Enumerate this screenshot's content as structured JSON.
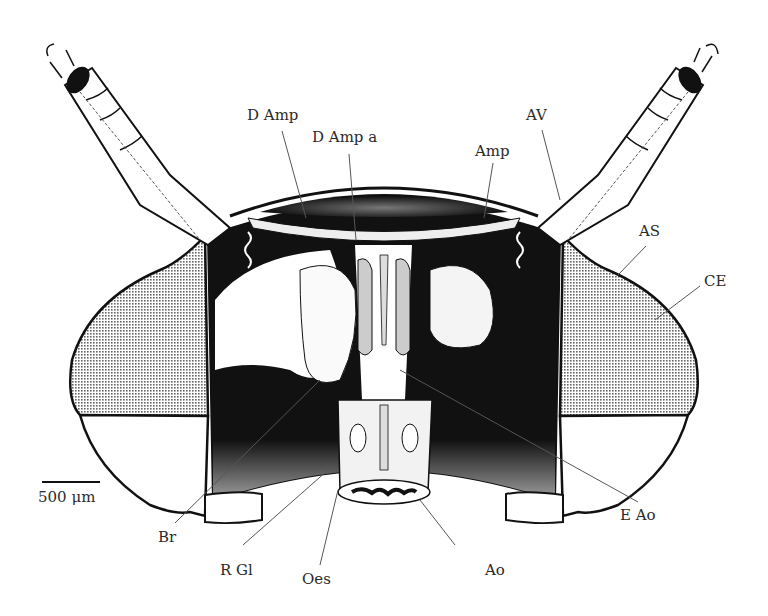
{
  "figure": {
    "colors": {
      "ink": "#111111",
      "leader": "#555555",
      "background": "#ffffff",
      "stipple": "#777777"
    }
  },
  "labels": {
    "d_amp": "D Amp",
    "d_amp_a": "D Amp a",
    "amp": "Amp",
    "av": "AV",
    "as": "AS",
    "ce": "CE",
    "br": "Br",
    "r_gl": "R Gl",
    "oes": "Oes",
    "ao": "Ao",
    "e_ao": "E Ao"
  },
  "scale_bar": {
    "label": "500 μm",
    "length_px": 58
  }
}
